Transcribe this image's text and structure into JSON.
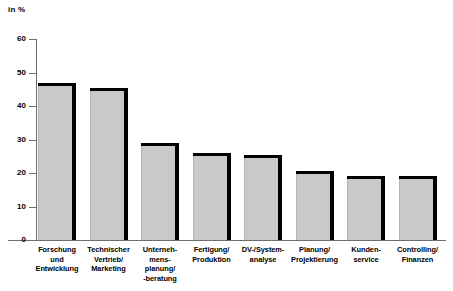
{
  "chart_data": {
    "type": "bar",
    "title": "",
    "subtitle": "",
    "unit_label": "in %",
    "xlabel": "",
    "ylabel": "",
    "ylim": [
      0,
      60
    ],
    "y_ticks": [
      0,
      10,
      20,
      30,
      40,
      50,
      60
    ],
    "grid": false,
    "legend": "none",
    "orientation": "vertical",
    "bar_style": {
      "fill": "#c9c9c9",
      "top_cap": "#000000",
      "right_shadow": "#000000",
      "axis_color": "#6e6e6e"
    },
    "categories": [
      "Forschung und Entwicklung",
      "Technischer Vertrieb/ Marketing",
      "Unternehmensplanung/ -beratung",
      "Fertigung/ Produktion",
      "DV-/Systemanalyse",
      "Planung/ Projektierung",
      "Kundenservice",
      "Controlling/ Finanzen"
    ],
    "category_lines": [
      [
        "Forschung",
        "und",
        "Entwicklung"
      ],
      [
        "Technischer",
        "Vertrieb/",
        "Marketing"
      ],
      [
        "Unterneh-",
        "mens-",
        "planung/",
        "-beratung"
      ],
      [
        "Fertigung/",
        "Produktion"
      ],
      [
        "DV-/System-",
        "analyse"
      ],
      [
        "Planung/",
        "Projektierung"
      ],
      [
        "Kunden-",
        "service"
      ],
      [
        "Controlling/",
        "Finanzen"
      ]
    ],
    "values": [
      47,
      45.5,
      29,
      26,
      25.5,
      20.5,
      19,
      19
    ]
  }
}
